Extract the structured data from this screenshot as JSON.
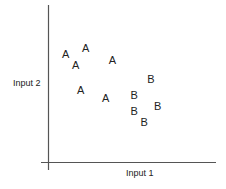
{
  "chart_data": {
    "type": "scatter",
    "title": "",
    "xlabel": "Input 1",
    "ylabel": "Input 2",
    "grid": false,
    "legend": null,
    "ticks": false,
    "xlim": [
      0,
      10
    ],
    "ylim": [
      0,
      10
    ],
    "series": [
      {
        "name": "A",
        "marker": "A",
        "points": [
          {
            "x": 1.0,
            "y": 6.8
          },
          {
            "x": 2.2,
            "y": 7.2
          },
          {
            "x": 1.6,
            "y": 6.1
          },
          {
            "x": 3.8,
            "y": 6.4
          },
          {
            "x": 1.9,
            "y": 4.5
          },
          {
            "x": 3.4,
            "y": 4.0
          }
        ]
      },
      {
        "name": "B",
        "marker": "B",
        "points": [
          {
            "x": 6.1,
            "y": 5.2
          },
          {
            "x": 5.1,
            "y": 4.2
          },
          {
            "x": 6.5,
            "y": 3.5
          },
          {
            "x": 5.1,
            "y": 3.2
          },
          {
            "x": 5.7,
            "y": 2.5
          }
        ]
      }
    ]
  },
  "colors": {
    "axis": "#555555",
    "text": "#222222",
    "background": "#ffffff"
  }
}
